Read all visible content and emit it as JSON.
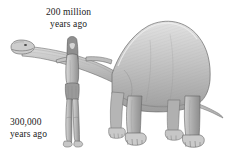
{
  "figure": {
    "name": "dinosaur-human-scale-comparison",
    "background_color": "#ffffff",
    "width": 225,
    "height": 157,
    "medium": "grayscale pencil illustration"
  },
  "labels": {
    "dinosaur": {
      "line1": "200 million",
      "line2": "years ago",
      "text_color": "#1b1b1b"
    },
    "human": {
      "line1": "300,000",
      "line2": "years ago",
      "text_color": "#1b1b1b"
    }
  },
  "subjects": [
    {
      "name": "sauropod-dinosaur",
      "label": "200 million years ago",
      "description": "Large long-necked sauropod dinosaur in side profile, head at left, tail at right"
    },
    {
      "name": "early-human",
      "label": "300,000 years ago",
      "description": "Early human standing upright with long hair and loincloth, one arm outstretched"
    }
  ],
  "palette": {
    "ink_dark": "#4a4a4a",
    "ink_mid": "#8a8a8a",
    "ink_light": "#bfbfbf",
    "ink_pale": "#dcdcdc",
    "outline": "#6f6f6f",
    "paper": "#ffffff"
  }
}
